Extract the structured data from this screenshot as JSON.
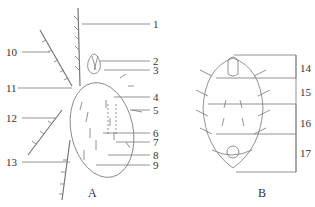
{
  "figure": {
    "panel_a": {
      "caption": "A",
      "right_labels": [
        {
          "n": "1",
          "y": 24
        },
        {
          "n": "2",
          "y": 61
        },
        {
          "n": "3",
          "y": 70
        },
        {
          "n": "4",
          "y": 97
        },
        {
          "n": "5",
          "y": 110
        },
        {
          "n": "6",
          "y": 133
        },
        {
          "n": "7",
          "y": 142
        },
        {
          "n": "8",
          "y": 155
        },
        {
          "n": "9",
          "y": 165
        }
      ],
      "left_labels": [
        {
          "n": "10",
          "y": 52
        },
        {
          "n": "11",
          "y": 88
        },
        {
          "n": "12",
          "y": 118
        },
        {
          "n": "13",
          "y": 162
        }
      ]
    },
    "panel_b": {
      "caption": "B",
      "right_labels": [
        {
          "n": "14",
          "y": 68
        },
        {
          "n": "15",
          "y": 92
        },
        {
          "n": "16",
          "y": 123
        },
        {
          "n": "17",
          "y": 153
        }
      ]
    },
    "line_color": "#777777",
    "text_color": "#333333"
  }
}
